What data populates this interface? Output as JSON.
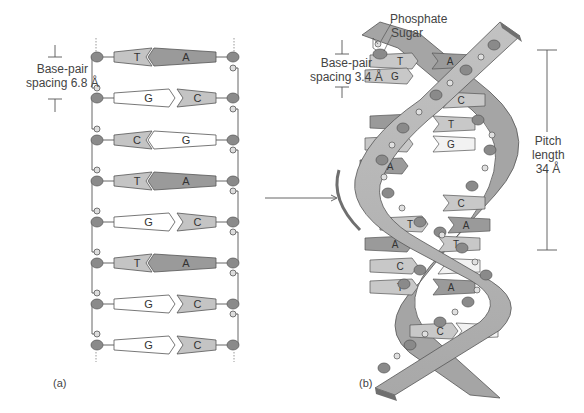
{
  "figure": {
    "panel_a": {
      "label": "(a)",
      "spacing_label_line1": "Base-pair",
      "spacing_label_line2": "spacing 6.8 Å",
      "base_pairs": [
        {
          "left": "T",
          "right": "A",
          "left_fill": "#c4c4c4",
          "right_fill": "#9a9a9a"
        },
        {
          "left": "G",
          "right": "C",
          "left_fill": "#ffffff",
          "right_fill": "#c4c4c4"
        },
        {
          "left": "C",
          "right": "G",
          "left_fill": "#c4c4c4",
          "right_fill": "#ffffff"
        },
        {
          "left": "T",
          "right": "A",
          "left_fill": "#c4c4c4",
          "right_fill": "#9a9a9a"
        },
        {
          "left": "G",
          "right": "C",
          "left_fill": "#ffffff",
          "right_fill": "#c4c4c4"
        },
        {
          "left": "T",
          "right": "A",
          "left_fill": "#c4c4c4",
          "right_fill": "#9a9a9a"
        },
        {
          "left": "G",
          "right": "C",
          "left_fill": "#ffffff",
          "right_fill": "#c4c4c4"
        },
        {
          "left": "G",
          "right": "C",
          "left_fill": "#ffffff",
          "right_fill": "#c4c4c4"
        }
      ]
    },
    "arrow": {
      "direction": "right"
    },
    "panel_b": {
      "label": "(b)",
      "phosphate_label": "Phosphate",
      "sugar_label": "Sugar",
      "spacing_label_line1": "Base-pair",
      "spacing_label_line2": "spacing 3.4 Å",
      "pitch_label_line1": "Pitch",
      "pitch_label_line2": "length",
      "pitch_label_line3": "34 Å",
      "base_pairs_top_to_bottom": [
        {
          "left": "T",
          "right": "A"
        },
        {
          "left": "G",
          "right": ""
        },
        {
          "left": "",
          "right": "C"
        },
        {
          "left": "A",
          "right": "T"
        },
        {
          "left": "C",
          "right": "G"
        },
        {
          "left": "A",
          "right": ""
        },
        {
          "left": "",
          "right": "C"
        },
        {
          "left": "T",
          "right": "A"
        },
        {
          "left": "A",
          "right": "T"
        },
        {
          "left": "C",
          "right": "G"
        },
        {
          "left": "T",
          "right": "A"
        },
        {
          "left": "C",
          "right": "G"
        }
      ]
    },
    "colors": {
      "sugar": "#8a8a8a",
      "backbone_light": "#b5b5b5",
      "backbone_dark": "#6f6f6f",
      "line": "#555555"
    }
  }
}
